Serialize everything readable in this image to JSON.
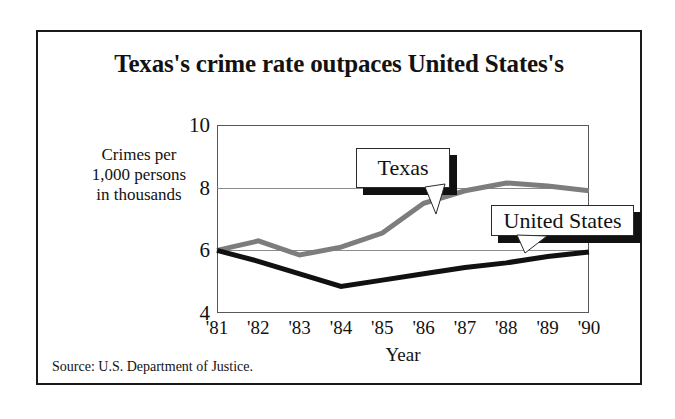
{
  "figure": {
    "title": "Texas's crime rate outpaces United States's",
    "source": "Source:  U.S. Department of Justice.",
    "y_caption_line1": "Crimes per",
    "y_caption_line2": "1,000 persons",
    "y_caption_line3": "in thousands"
  },
  "colors": {
    "texas_line": "#7d7d7d",
    "us_line": "#111111",
    "frame": "#1a1a1a",
    "gridline": "#888b8f",
    "background": "#ffffff"
  },
  "callouts": {
    "texas": "Texas",
    "united_states": "United States"
  },
  "chart_data": {
    "type": "line",
    "title": "Texas's crime rate outpaces United States's",
    "xlabel": "Year",
    "ylabel": "Crimes per 1,000 persons in thousands",
    "categories": [
      "'81",
      "'82",
      "'83",
      "'84",
      "'85",
      "'86",
      "'87",
      "'88",
      "'89",
      "'90"
    ],
    "x": [
      1981,
      1982,
      1983,
      1984,
      1985,
      1986,
      1987,
      1988,
      1989,
      1990
    ],
    "ylim": [
      4,
      10
    ],
    "yticks": [
      4,
      6,
      8,
      10
    ],
    "ytick_labels": [
      "4",
      "6",
      "8",
      "10"
    ],
    "grid": true,
    "legend": "inline-callouts",
    "series": [
      {
        "name": "Texas",
        "color": "#7d7d7d",
        "values": [
          6.0,
          6.3,
          5.85,
          6.1,
          6.55,
          7.5,
          7.9,
          8.15,
          8.05,
          7.9
        ]
      },
      {
        "name": "United States",
        "color": "#111111",
        "values": [
          6.0,
          5.65,
          5.25,
          4.85,
          5.05,
          5.25,
          5.45,
          5.6,
          5.8,
          5.95
        ]
      }
    ],
    "annotations": [
      {
        "text": "Texas",
        "series": "Texas",
        "points_to_year": 1985
      },
      {
        "text": "United States",
        "series": "United States",
        "points_to_year": 1988
      }
    ]
  }
}
